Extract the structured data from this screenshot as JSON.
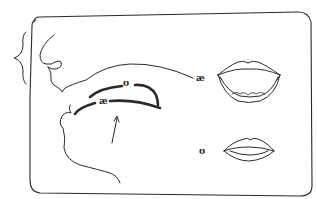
{
  "diagram": {
    "type": "articulation-diagram",
    "labels": {
      "tongue_high": "ʊ",
      "tongue_low": "æ",
      "lips_open": "æ",
      "lips_rounded": "ʊ"
    },
    "colors": {
      "line": "#2a2a2a",
      "background": "#ffffff"
    }
  }
}
